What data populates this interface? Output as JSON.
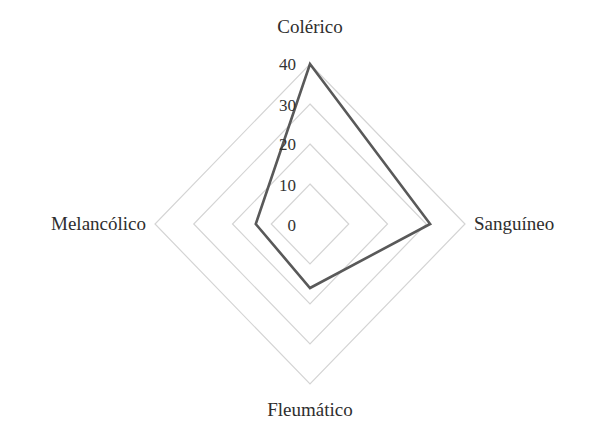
{
  "chart_data": {
    "type": "radar",
    "title": "",
    "categories": [
      "Colérico",
      "Sanguíneo",
      "Fleumático",
      "Melancólico"
    ],
    "series": [
      {
        "name": "Temperamento",
        "values": [
          40,
          31,
          16,
          14
        ],
        "color": "#595959"
      }
    ],
    "radial_axis": {
      "min": 0,
      "max": 40,
      "ticks": [
        0,
        10,
        20,
        30,
        40
      ],
      "tick_labels": [
        "0",
        "10",
        "20",
        "30",
        "40"
      ]
    },
    "grid": true,
    "grid_shape": "polygon",
    "legend": null
  },
  "colors": {
    "background": "#ffffff",
    "grid": "#d4d4d4",
    "series": "#595959",
    "text": "#2e2e2e"
  },
  "labels": {
    "top": "Colérico",
    "right": "Sanguíneo",
    "bottom": "Fleumático",
    "left": "Melancólico"
  },
  "ticks": {
    "t0": "0",
    "t10": "10",
    "t20": "20",
    "t30": "30",
    "t40": "40"
  }
}
